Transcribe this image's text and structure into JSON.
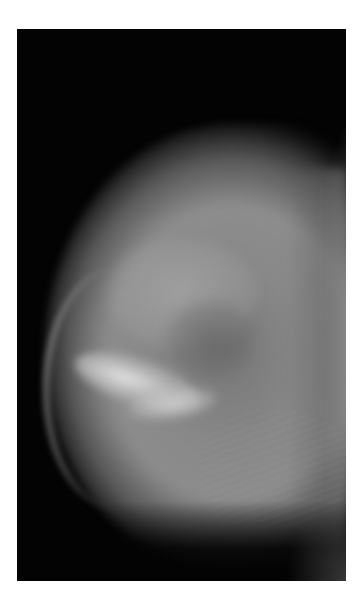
{
  "image": {
    "subject": "mammogram",
    "view": "mediolateral oblique",
    "modality": "X-ray",
    "colors": {
      "page_background": "#ffffff",
      "film_background": "#030303",
      "tissue_mid": "#8c8c8c",
      "tissue_dense": "#e0e0e0",
      "pectoral": "#a0a0a0"
    },
    "frame": {
      "left": 17,
      "top": 29,
      "width": 329,
      "height": 552
    }
  }
}
